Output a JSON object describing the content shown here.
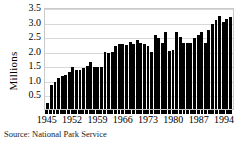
{
  "chart_data": {
    "type": "bar",
    "title": "",
    "xlabel": "",
    "ylabel": "Millions",
    "ylim": [
      0,
      3.5
    ],
    "ytick_labels": [
      "0.5",
      "1.0",
      "1.5",
      "2.0",
      "2.5",
      "3.0",
      "3.5"
    ],
    "ytick_values": [
      0.5,
      1.0,
      1.5,
      2.0,
      2.5,
      3.0,
      3.5
    ],
    "grid": true,
    "legend": "none",
    "xtick_labels": [
      "1945",
      "1952",
      "1959",
      "1966",
      "1973",
      "1980",
      "1987",
      "1994"
    ],
    "xtick_values": [
      1945,
      1952,
      1959,
      1966,
      1973,
      1980,
      1987,
      1994
    ],
    "categories": [
      1945,
      1946,
      1947,
      1948,
      1949,
      1950,
      1951,
      1952,
      1953,
      1954,
      1955,
      1956,
      1957,
      1958,
      1959,
      1960,
      1961,
      1962,
      1963,
      1964,
      1965,
      1966,
      1967,
      1968,
      1969,
      1970,
      1971,
      1972,
      1973,
      1974,
      1975,
      1976,
      1977,
      1978,
      1979,
      1980,
      1981,
      1982,
      1983,
      1984,
      1985,
      1986,
      1987,
      1988,
      1989,
      1990,
      1991,
      1992,
      1993,
      1994,
      1995,
      1996
    ],
    "values": [
      0.22,
      0.82,
      0.92,
      1.08,
      1.15,
      1.18,
      1.27,
      1.43,
      1.35,
      1.33,
      1.42,
      1.47,
      1.62,
      1.44,
      1.44,
      1.45,
      1.94,
      1.93,
      1.96,
      2.15,
      2.24,
      2.23,
      2.2,
      2.3,
      2.24,
      2.37,
      2.26,
      2.22,
      2.15,
      1.97,
      2.55,
      2.44,
      2.28,
      2.64,
      2.0,
      2.04,
      2.63,
      2.48,
      2.26,
      2.28,
      2.28,
      2.42,
      2.55,
      2.64,
      2.28,
      2.72,
      2.93,
      3.05,
      3.18,
      2.97,
      3.08,
      3.17
    ],
    "bar_color": "#000000",
    "grid_color": "#d8d8d8",
    "frame_color": "#c9c9c9"
  },
  "source_note": "Source: National Park Service"
}
